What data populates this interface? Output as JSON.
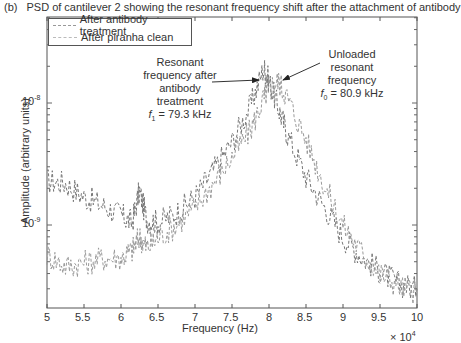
{
  "caption": {
    "tag": "(b)",
    "text": "PSD of cantilever 2 showing the resonant frequency shift after the attachment of antibody"
  },
  "legend": {
    "items": [
      {
        "label": "After antibody treatment",
        "color": "#888888",
        "style": "dashed"
      },
      {
        "label": "After piranha clean",
        "color": "#aaaaaa",
        "style": "dashed"
      }
    ]
  },
  "annotations": {
    "left": {
      "lines": [
        "Resonant",
        "frequency after",
        "antibody",
        "treatment"
      ],
      "formula_var": "f",
      "formula_sub": "1",
      "formula_rest": " = 79.3 kHz"
    },
    "right": {
      "lines": [
        "Unloaded",
        "resonant",
        "frequency"
      ],
      "formula_var": "f",
      "formula_sub": "0",
      "formula_rest": " = 80.9 kHz"
    }
  },
  "axes": {
    "xlabel": "Frequency (Hz)",
    "ylabel": "Amplitude (arbitrary units)",
    "x_multiplier_base": "× 10",
    "x_multiplier_exp": "4",
    "x_ticks": [
      "5",
      "5.5",
      "6",
      "6.5",
      "7",
      "7.5",
      "8",
      "8.5",
      "9",
      "9.5",
      "10"
    ],
    "y_ticks": [
      {
        "base": "10",
        "exp": "-8"
      },
      {
        "base": "10",
        "exp": "-9"
      }
    ]
  },
  "chart_data": {
    "type": "line",
    "title": "PSD of cantilever 2 showing the resonant frequency shift after the attachment of antibody",
    "xlabel": "Frequency (Hz)",
    "ylabel": "Amplitude (arbitrary units)",
    "x_scale_note": "x values in units of 1e4 Hz",
    "xlim": [
      5,
      10
    ],
    "ylim": [
      2.1e-10,
      5e-08
    ],
    "yscale": "log",
    "grid": false,
    "legend_position": "upper left",
    "x": [
      5.0,
      5.25,
      5.5,
      5.75,
      6.0,
      6.15,
      6.25,
      6.35,
      6.5,
      6.75,
      7.0,
      7.25,
      7.5,
      7.75,
      7.93,
      8.0,
      8.13,
      8.25,
      8.5,
      8.75,
      9.0,
      9.25,
      9.5,
      9.75,
      10.0
    ],
    "series": [
      {
        "name": "After antibody treatment",
        "values": [
          2.3e-09,
          2.2e-09,
          1.7e-09,
          1.45e-09,
          1.2e-09,
          1.05e-09,
          1.9e-09,
          1.1e-09,
          1.05e-09,
          1.25e-09,
          1.7e-09,
          2.8e-09,
          4.8e-09,
          9.5e-09,
          1.95e-08,
          1.5e-08,
          9e-09,
          5.5e-09,
          2.5e-09,
          1.4e-09,
          8e-10,
          5.5e-10,
          4.2e-10,
          3.3e-10,
          3e-10
        ]
      },
      {
        "name": "After piranha clean",
        "values": [
          5.7e-10,
          4.6e-10,
          4.9e-10,
          5.3e-10,
          5.4e-10,
          6.2e-10,
          8e-10,
          6.5e-10,
          7.8e-10,
          1e-09,
          1.4e-09,
          2.2e-09,
          3.6e-09,
          6e-09,
          1.1e-08,
          1.35e-08,
          1.5e-08,
          1.1e-08,
          5e-09,
          2.1e-09,
          1e-09,
          6e-10,
          4e-10,
          3.2e-10,
          2.8e-10
        ]
      }
    ],
    "annotations": [
      {
        "text": "Resonant frequency after antibody treatment f1 = 79.3 kHz",
        "x": 7.93
      },
      {
        "text": "Unloaded resonant frequency f0 = 80.9 kHz",
        "x": 8.13
      }
    ]
  }
}
